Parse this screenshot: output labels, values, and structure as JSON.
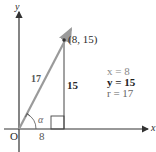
{
  "diagram": {
    "axes": {
      "x_label": "x",
      "y_label": "y",
      "origin_label": "O"
    },
    "point": {
      "label": "(8, 15)",
      "x": 8,
      "y": 15
    },
    "vector": {
      "length_label": "17",
      "color": "#9a9a9a"
    },
    "sides": {
      "adjacent_label": "8",
      "opposite_label": "15"
    },
    "angle_label": "α",
    "values": {
      "x_line": "x =  8",
      "y_line": "y = 15",
      "r_line": "r = 17"
    },
    "colors": {
      "axis": "#333333",
      "vector": "#9a9a9a",
      "text": "#2a2a2a",
      "muted_text": "#777777"
    }
  }
}
